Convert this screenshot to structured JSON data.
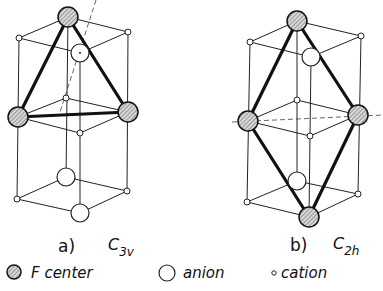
{
  "panels": [
    {
      "label": "a)",
      "symmetry_main": "C",
      "symmetry_sub": "3v"
    },
    {
      "label": "b)",
      "symmetry_main": "C",
      "symmetry_sub": "2h"
    }
  ],
  "legend": {
    "fcenter": "F center",
    "anion": "anion",
    "cation": "cation"
  }
}
